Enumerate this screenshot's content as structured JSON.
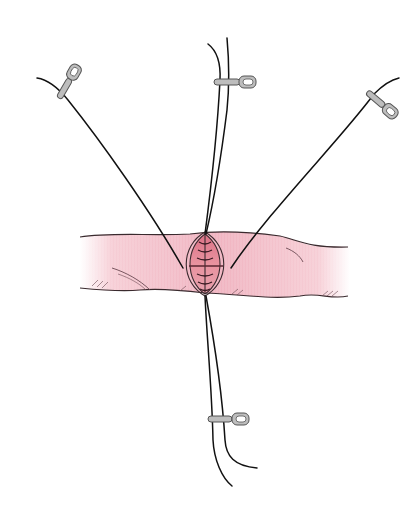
{
  "figure": {
    "colors": {
      "background": "#ffffff",
      "vessel_fill": "#f2b9c4",
      "vessel_fill_light": "#fbe3e8",
      "incision_fill": "#e48a9c",
      "outline": "#3a2a2e",
      "suture": "#111111",
      "clip_fill": "#b9b9b9",
      "clip_stroke": "#555555"
    },
    "sutures": [
      {
        "name": "upper-left"
      },
      {
        "name": "top"
      },
      {
        "name": "upper-right"
      },
      {
        "name": "bottom"
      }
    ],
    "clips": [
      {
        "name": "upper-left"
      },
      {
        "name": "top"
      },
      {
        "name": "upper-right"
      },
      {
        "name": "bottom"
      }
    ]
  }
}
